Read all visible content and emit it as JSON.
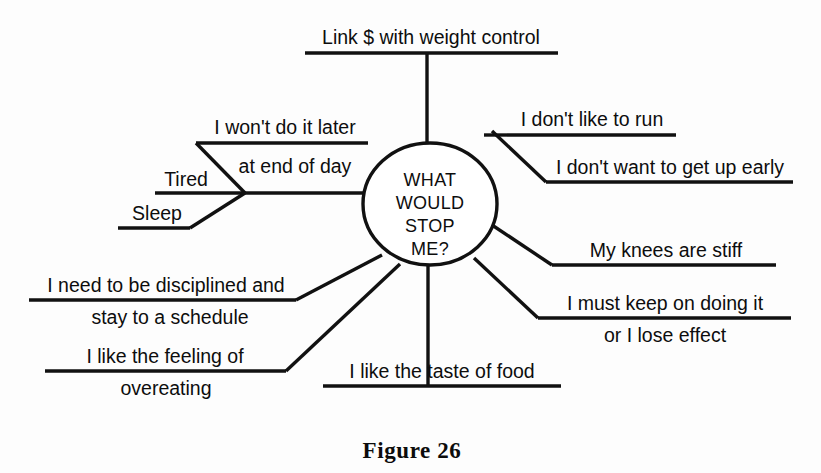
{
  "figure": {
    "caption": "Figure 26",
    "hub": {
      "lines": [
        "WHAT",
        "WOULD",
        "STOP",
        "ME?"
      ]
    },
    "branches": [
      {
        "id": "link-money-weight-control",
        "position": "top",
        "lines": [
          "Link $ with weight control"
        ]
      },
      {
        "id": "wont-do-it-later",
        "position": "upper-left",
        "lines": [
          "I won't do it later",
          "at end of day"
        ]
      },
      {
        "id": "tired",
        "position": "left",
        "lines": [
          "Tired"
        ]
      },
      {
        "id": "sleep",
        "position": "lower-left-upper",
        "lines": [
          "Sleep"
        ]
      },
      {
        "id": "dont-like-to-run",
        "position": "upper-right",
        "lines": [
          "I don't like to run"
        ]
      },
      {
        "id": "dont-want-to-get-up-early",
        "position": "right-upper",
        "lines": [
          "I don't want to get up early"
        ]
      },
      {
        "id": "knees-are-stiff",
        "position": "right-lower",
        "lines": [
          "My knees are stiff"
        ]
      },
      {
        "id": "must-keep-on-doing-it",
        "position": "lower-right",
        "lines": [
          "I must keep on doing it",
          "or I lose effect"
        ]
      },
      {
        "id": "need-to-be-disciplined",
        "position": "left-lower",
        "lines": [
          "I need to be disciplined and",
          "stay to a schedule"
        ]
      },
      {
        "id": "like-the-feeling-of-overeating",
        "position": "lower-left",
        "lines": [
          "I like the feeling of",
          "overeating"
        ]
      },
      {
        "id": "like-the-taste-of-food",
        "position": "bottom",
        "lines": [
          "I like the taste of food"
        ]
      }
    ],
    "colors": {
      "ink": "#111111",
      "background": "#ffffff"
    }
  }
}
